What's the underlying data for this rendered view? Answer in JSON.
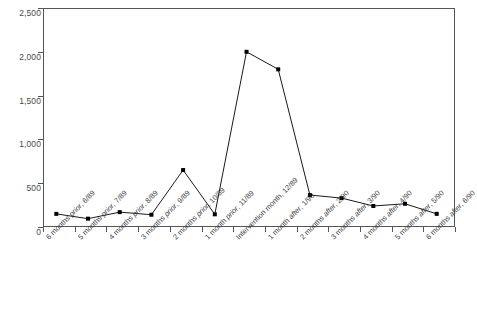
{
  "chart_data": {
    "type": "line",
    "title": "",
    "xlabel": "",
    "ylabel": "",
    "ylim": [
      0,
      2500
    ],
    "ytick_values": [
      0,
      500,
      1000,
      1500,
      2000,
      2500
    ],
    "ytick_labels": [
      "0",
      "500",
      "1,000",
      "1,500",
      "2,000",
      "2,500"
    ],
    "grid": false,
    "legend": "none",
    "marker": "filled-square",
    "line_color": "#1a1a1a",
    "categories": [
      "6 months prior, 6/89",
      "5 months prior, 7/89",
      "4 months prior, 8/89",
      "3 months prior, 9/89",
      "2 months prior, 10/89",
      "1 month prior, 11/89",
      "Intervention month, 12/89",
      "1 month after, 1/90",
      "2 months after, 2/90",
      "3 months after, 3/90",
      "4 months after, 4/90",
      "5 months after, 5/90",
      "6 months after, 6/90"
    ],
    "category_parts": [
      {
        "pre": "6 months ",
        "em": "prior",
        "post": ", 6/89"
      },
      {
        "pre": "5 months ",
        "em": "prior",
        "post": ", 7/89"
      },
      {
        "pre": "4 months ",
        "em": "prior",
        "post": ", 8/89"
      },
      {
        "pre": "3 months ",
        "em": "prior",
        "post": ", 9/89"
      },
      {
        "pre": "2 months ",
        "em": "prior",
        "post": ", 10/89"
      },
      {
        "pre": "1 month ",
        "em": "prior",
        "post": ", 11/89"
      },
      {
        "pre": "Intervention month",
        "em": "",
        "post": ", 12/89"
      },
      {
        "pre": "1 month ",
        "em": "after",
        "post": ", 1/90"
      },
      {
        "pre": "2 months ",
        "em": "after",
        "post": ", 2/90"
      },
      {
        "pre": "3 months ",
        "em": "after",
        "post": ", 3/90"
      },
      {
        "pre": "4 months ",
        "em": "after",
        "post": ", 4/90"
      },
      {
        "pre": "5 months ",
        "em": "after",
        "post": ", 5/90"
      },
      {
        "pre": "6 months ",
        "em": "after",
        "post": ", 6/90"
      }
    ],
    "values": [
      150,
      95,
      170,
      140,
      650,
      145,
      2000,
      1800,
      365,
      330,
      240,
      265,
      150
    ]
  }
}
